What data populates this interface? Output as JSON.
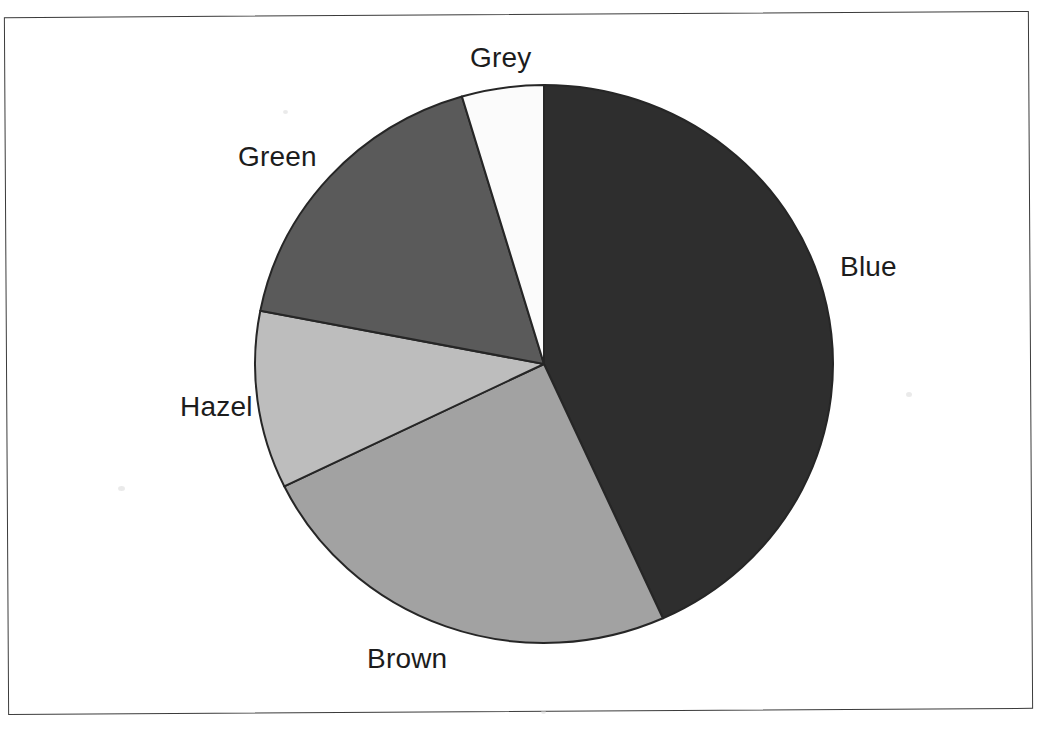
{
  "page": {
    "background_color": "#ffffff",
    "border_color": "#3b3b3b"
  },
  "chart_data": {
    "type": "pie",
    "title": "",
    "subtitle": "",
    "xlabel": "",
    "ylabel": "",
    "legend_position": "none",
    "grid": false,
    "label_placement": "outside",
    "start_angle_deg": 0,
    "direction": "clockwise",
    "categories": [
      "Blue",
      "Brown",
      "Hazel",
      "Green",
      "Grey"
    ],
    "values": [
      43.3,
      24.5,
      10.3,
      17.4,
      4.5
    ],
    "units": "percent",
    "slices": [
      {
        "label": "Blue",
        "value": 43.3,
        "start_angle_deg": 0.0,
        "end_angle_deg": 155.7,
        "color": "#2e2e2e"
      },
      {
        "label": "Brown",
        "value": 24.5,
        "start_angle_deg": 155.7,
        "end_angle_deg": 244.0,
        "color": "#a2a2a2"
      },
      {
        "label": "Hazel",
        "value": 10.3,
        "start_angle_deg": 244.0,
        "end_angle_deg": 281.0,
        "color": "#bdbdbd"
      },
      {
        "label": "Green",
        "value": 17.4,
        "start_angle_deg": 281.0,
        "end_angle_deg": 343.5,
        "color": "#5a5a5a"
      },
      {
        "label": "Grey",
        "value": 4.5,
        "start_angle_deg": 343.5,
        "end_angle_deg": 360.0,
        "color": "#fbfbfb"
      }
    ],
    "geometry": {
      "center_x": 544,
      "center_y": 364,
      "radius_x": 289,
      "radius_y": 279,
      "outline_color": "#262626"
    }
  },
  "labels": {
    "grey": "Grey",
    "blue": "Blue",
    "green": "Green",
    "hazel": "Hazel",
    "brown": "Brown"
  }
}
